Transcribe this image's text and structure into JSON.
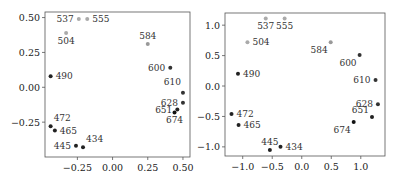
{
  "chart_data": [
    {
      "type": "scatter",
      "title": "",
      "xlabel": "",
      "ylabel": "",
      "xlim": [
        -0.48,
        0.55
      ],
      "ylim": [
        -0.5,
        0.54
      ],
      "xticks": [
        -0.25,
        0.0,
        0.25,
        0.5
      ],
      "xtick_labels": [
        "−0.25",
        "0.00",
        "0.25",
        "0.50"
      ],
      "yticks": [
        -0.25,
        0.0,
        0.25,
        0.5
      ],
      "ytick_labels": [
        "−0.25",
        "0.00",
        "0.25",
        "0.50"
      ],
      "grid": false,
      "points": [
        {
          "label": "434",
          "x": -0.21,
          "y": -0.43,
          "color": "#222222",
          "label_pos": "upper-right"
        },
        {
          "label": "445",
          "x": -0.26,
          "y": -0.42,
          "color": "#222222",
          "label_pos": "left"
        },
        {
          "label": "465",
          "x": -0.41,
          "y": -0.31,
          "color": "#222222",
          "label_pos": "right"
        },
        {
          "label": "472",
          "x": -0.44,
          "y": -0.28,
          "color": "#222222",
          "label_pos": "upper-right"
        },
        {
          "label": "490",
          "x": -0.44,
          "y": 0.08,
          "color": "#222222",
          "label_pos": "right"
        },
        {
          "label": "504",
          "x": -0.33,
          "y": 0.39,
          "color": "#aaaaaa",
          "label_pos": "below"
        },
        {
          "label": "537",
          "x": -0.24,
          "y": 0.49,
          "color": "#aaaaaa",
          "label_pos": "left"
        },
        {
          "label": "555",
          "x": -0.18,
          "y": 0.49,
          "color": "#aaaaaa",
          "label_pos": "right"
        },
        {
          "label": "584",
          "x": 0.25,
          "y": 0.31,
          "color": "#999999",
          "label_pos": "above"
        },
        {
          "label": "600",
          "x": 0.41,
          "y": 0.14,
          "color": "#333333",
          "label_pos": "left"
        },
        {
          "label": "610",
          "x": 0.5,
          "y": -0.04,
          "color": "#333333",
          "label_pos": "above-left"
        },
        {
          "label": "628",
          "x": 0.5,
          "y": -0.11,
          "color": "#333333",
          "label_pos": "left"
        },
        {
          "label": "651",
          "x": 0.46,
          "y": -0.16,
          "color": "#222222",
          "label_pos": "left"
        },
        {
          "label": "674",
          "x": 0.44,
          "y": -0.18,
          "color": "#111111",
          "label_pos": "below"
        }
      ]
    },
    {
      "type": "scatter",
      "title": "",
      "xlabel": "",
      "ylabel": "",
      "xlim": [
        -1.3,
        1.41
      ],
      "ylim": [
        -1.15,
        1.2
      ],
      "xticks": [
        -1.0,
        -0.5,
        0.0,
        0.5,
        1.0
      ],
      "xtick_labels": [
        "−1.0",
        "−0.5",
        "0.0",
        "0.5",
        "1.0"
      ],
      "yticks": [
        -1.0,
        -0.5,
        0.0,
        0.5,
        1.0
      ],
      "ytick_labels": [
        "−1.0",
        "−0.5",
        "0.0",
        "0.5",
        "1.0"
      ],
      "grid": false,
      "points": [
        {
          "label": "434",
          "x": -0.36,
          "y": -1.0,
          "color": "#222222",
          "label_pos": "right"
        },
        {
          "label": "445",
          "x": -0.54,
          "y": -1.05,
          "color": "#222222",
          "label_pos": "above"
        },
        {
          "label": "465",
          "x": -1.07,
          "y": -0.64,
          "color": "#222222",
          "label_pos": "right"
        },
        {
          "label": "472",
          "x": -1.19,
          "y": -0.46,
          "color": "#222222",
          "label_pos": "right"
        },
        {
          "label": "490",
          "x": -1.08,
          "y": 0.2,
          "color": "#222222",
          "label_pos": "right"
        },
        {
          "label": "504",
          "x": -0.92,
          "y": 0.72,
          "color": "#aaaaaa",
          "label_pos": "right"
        },
        {
          "label": "537",
          "x": -0.61,
          "y": 1.11,
          "color": "#aaaaaa",
          "label_pos": "below"
        },
        {
          "label": "555",
          "x": -0.29,
          "y": 1.11,
          "color": "#aaaaaa",
          "label_pos": "below"
        },
        {
          "label": "584",
          "x": 0.49,
          "y": 0.72,
          "color": "#999999",
          "label_pos": "below-left"
        },
        {
          "label": "600",
          "x": 0.98,
          "y": 0.51,
          "color": "#333333",
          "label_pos": "below-left"
        },
        {
          "label": "610",
          "x": 1.25,
          "y": 0.1,
          "color": "#333333",
          "label_pos": "left"
        },
        {
          "label": "628",
          "x": 1.29,
          "y": -0.3,
          "color": "#333333",
          "label_pos": "left"
        },
        {
          "label": "651",
          "x": 1.19,
          "y": -0.51,
          "color": "#222222",
          "label_pos": "upper-left"
        },
        {
          "label": "674",
          "x": 0.88,
          "y": -0.59,
          "color": "#111111",
          "label_pos": "below-left"
        }
      ]
    }
  ]
}
